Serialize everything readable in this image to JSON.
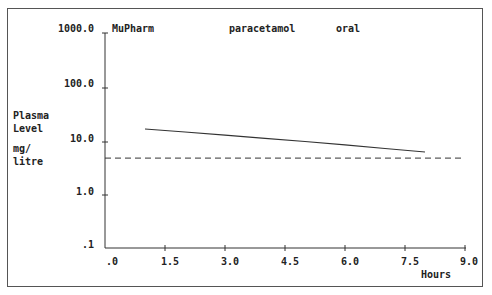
{
  "header": {
    "source": "MuPharm",
    "drug": "paracetamol",
    "route": "oral"
  },
  "y_axis": {
    "label_lines": [
      "Plasma",
      "Level"
    ],
    "unit_lines": [
      "mg/",
      "litre"
    ],
    "ticks": [
      "1000.0",
      "100.0",
      "10.0",
      "1.0",
      ".1"
    ]
  },
  "x_axis": {
    "label": "Hours",
    "ticks": [
      ".0",
      "1.5",
      "3.0",
      "4.5",
      "6.0",
      "7.5",
      "9.0"
    ]
  },
  "colors": {
    "ink": "#222222",
    "frame": "#555555",
    "background": "#ffffff"
  },
  "chart_data": {
    "type": "line",
    "title": "MuPharm  paracetamol  oral",
    "xlabel": "Hours",
    "ylabel": "Plasma Level mg/litre",
    "xlim": [
      0,
      9
    ],
    "ylim": [
      0.1,
      1000
    ],
    "yscale": "log",
    "x_ticks": [
      0,
      1.5,
      3.0,
      4.5,
      6.0,
      7.5,
      9.0
    ],
    "y_ticks": [
      0.1,
      1,
      10,
      100,
      1000
    ],
    "grid": false,
    "legend": "none",
    "series": [
      {
        "name": "plasma concentration",
        "style": "solid",
        "x": [
          1.0,
          2.0,
          3.0,
          4.0,
          5.0,
          6.0,
          7.0,
          8.0
        ],
        "y": [
          16.4,
          14.4,
          12.6,
          11.0,
          9.6,
          8.3,
          7.1,
          6.1
        ]
      },
      {
        "name": "threshold level",
        "style": "dashed",
        "x": [
          0,
          9.0
        ],
        "y": [
          4.7,
          4.7
        ]
      }
    ]
  }
}
